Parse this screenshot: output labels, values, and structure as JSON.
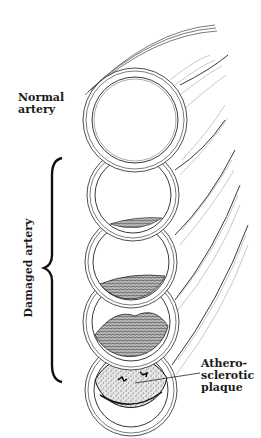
{
  "figure": {
    "labels": {
      "normal": "Normal\nartery",
      "normal_line1": "Normal",
      "normal_line2": "artery",
      "damaged": "Damaged artery",
      "plaque_line1": "Athero-",
      "plaque_line2": "sclerotic",
      "plaque_line3": "plaque"
    },
    "stages": [
      {
        "name": "normal",
        "center": [
          135,
          120
        ],
        "outer_r": 52,
        "inner_r": 43,
        "plaque": "none"
      },
      {
        "name": "damaged-1",
        "center": [
          133,
          195
        ],
        "outer_r": 46,
        "inner_r": 38,
        "plaque": "thin"
      },
      {
        "name": "damaged-2",
        "center": [
          131,
          262
        ],
        "outer_r": 46,
        "inner_r": 38,
        "plaque": "small"
      },
      {
        "name": "damaged-3",
        "center": [
          131,
          322
        ],
        "outer_r": 48,
        "inner_r": 39,
        "plaque": "medium"
      },
      {
        "name": "damaged-4",
        "center": [
          131,
          390
        ],
        "outer_r": 46,
        "inner_r": 37,
        "plaque": "large"
      }
    ],
    "colors": {
      "ink": "#222222",
      "background": "#ffffff"
    }
  }
}
